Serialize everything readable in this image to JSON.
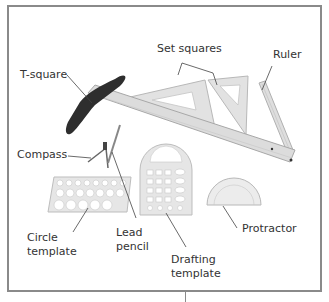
{
  "figure": {
    "labels": {
      "t_square": "T-square",
      "set_squares": "Set squares",
      "ruler": "Ruler",
      "compass": "Compass",
      "circle_template_line1": "Circle",
      "circle_template_line2": "template",
      "lead_pencil_line1": "Lead",
      "lead_pencil_line2": "pencil",
      "drafting_template_line1": "Drafting",
      "drafting_template_line2": "template",
      "protractor": "Protractor"
    },
    "colors": {
      "frame": "#8a8a8a",
      "label_text": "#333333",
      "leader_line": "#444444",
      "plastic": "#d8d8d8",
      "plastic_edge": "#b5b5b5",
      "t_square_head": "#2e2e2e"
    }
  }
}
